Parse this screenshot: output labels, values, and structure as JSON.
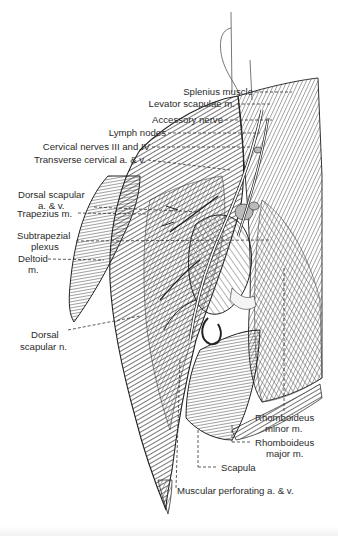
{
  "figure": {
    "labels": [
      {
        "id": "splenius",
        "text": "Splenius muscle"
      },
      {
        "id": "levator",
        "text": "Levator scapulae m."
      },
      {
        "id": "accessory",
        "text": "Accessory nerve"
      },
      {
        "id": "lymph",
        "text": "Lymph nodes"
      },
      {
        "id": "cervical_nerves",
        "text": "Cervical nerves III and IV"
      },
      {
        "id": "transverse_cervical",
        "text": "Transverse cervical a. & v."
      },
      {
        "id": "dorsal_scapular_av_1",
        "text": "Dorsal scapular"
      },
      {
        "id": "dorsal_scapular_av_2",
        "text": "a. & v."
      },
      {
        "id": "trapezius",
        "text": "Trapezius m."
      },
      {
        "id": "subtrapezial_1",
        "text": "Subtrapezial"
      },
      {
        "id": "subtrapezial_2",
        "text": "plexus"
      },
      {
        "id": "deltoid_1",
        "text": "Deltoid"
      },
      {
        "id": "deltoid_2",
        "text": "m."
      },
      {
        "id": "dorsal_scapular_n_1",
        "text": "Dorsal"
      },
      {
        "id": "dorsal_scapular_n_2",
        "text": "scapular n."
      },
      {
        "id": "rhomboid_minor_1",
        "text": "Rhomboideus"
      },
      {
        "id": "rhomboid_minor_2",
        "text": "minor m."
      },
      {
        "id": "rhomboid_major_1",
        "text": "Rhomboideus"
      },
      {
        "id": "rhomboid_major_2",
        "text": "major m."
      },
      {
        "id": "scapula",
        "text": "Scapula"
      },
      {
        "id": "muscular_perforating",
        "text": "Muscular perforating a. & v."
      }
    ],
    "colors": {
      "ink": "#2b2b2b",
      "paper": "#ffffff",
      "shade_dark": "#3a3a3a",
      "shade_mid": "#8a8a8a",
      "shade_light": "#cfcfcf"
    }
  }
}
